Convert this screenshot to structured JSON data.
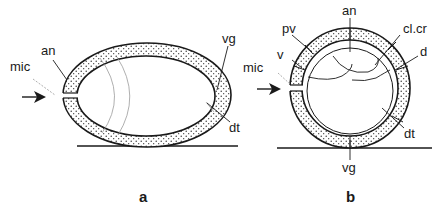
{
  "figure": {
    "type": "egg cross-section schematic",
    "colors": {
      "stroke": "#1a1a1a",
      "stipple": "#2a2a2a",
      "background": "#ffffff",
      "leader_dashed": "#888888"
    },
    "panel_a": {
      "letter": "a",
      "labels": {
        "mic": "mic",
        "an": "an",
        "vg": "vg",
        "dt": "dt"
      }
    },
    "panel_b": {
      "letter": "b",
      "labels": {
        "an": "an",
        "pv": "pv",
        "cl_cr": "cl.cr",
        "v": "v",
        "d": "d",
        "mic": "mic",
        "dt": "dt",
        "vg": "vg"
      }
    }
  }
}
